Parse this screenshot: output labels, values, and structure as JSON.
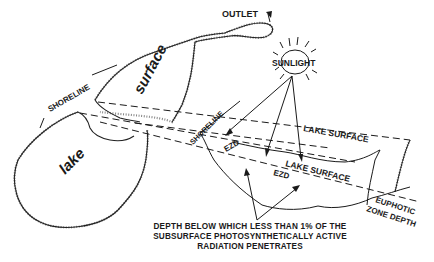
{
  "diagram": {
    "labels": {
      "outlet": "OUTLET",
      "sunlight": "SUNLIGHT",
      "shoreline_left": "SHORELINE",
      "shoreline_section": "SHORELINE",
      "surface_word": "surface",
      "lake_word": "lake",
      "lake_surface_upper": "LAKE SURFACE",
      "lake_surface_lower": "LAKE SURFACE",
      "ezd_upper": "EZD",
      "ezd_lower": "EZD",
      "euphotic_line1": "EUPHOTIC",
      "euphotic_line2": "ZONE DEPTH"
    },
    "caption": {
      "line1": "DEPTH BELOW WHICH LESS THAN 1% OF THE",
      "line2": "SUBSURFACE PHOTOSYNTHETICALLY ACTIVE",
      "line3": "RADIATION PENETRATES"
    },
    "colors": {
      "ink": "#1a1a1a",
      "background": "#ffffff"
    }
  }
}
